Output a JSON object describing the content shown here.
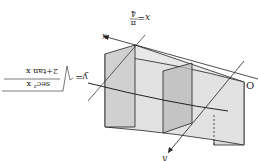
{
  "figure": {
    "rotation_deg": 180,
    "colors": {
      "face_light": "#e6e6e6",
      "face_mid": "#d4d4d4",
      "face_dark": "#b8b8b8",
      "stroke": "#222222",
      "background": "#ffffff"
    }
  },
  "labels": {
    "x_axis": "x",
    "y_axis": "y",
    "origin": "O",
    "x_bound_lhs": "x=",
    "x_bound_num": "π",
    "x_bound_den": "4",
    "curve_lhs": "y=",
    "curve_num": "sec² x",
    "curve_den": "2+tan x"
  }
}
